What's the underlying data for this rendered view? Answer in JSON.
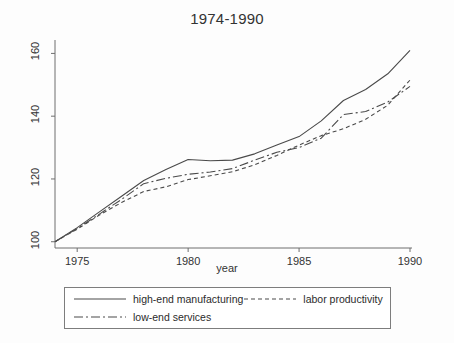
{
  "chart_data": {
    "type": "line",
    "title": "1974-1990",
    "xlabel": "year",
    "ylabel": "",
    "xlim": [
      1974,
      1990
    ],
    "ylim": [
      98,
      163
    ],
    "xticks": [
      1975,
      1980,
      1985,
      1990
    ],
    "yticks": [
      100,
      120,
      140,
      160
    ],
    "grid": false,
    "legend_position": "below-axis",
    "x": [
      1974,
      1975,
      1976,
      1977,
      1978,
      1979,
      1980,
      1981,
      1982,
      1983,
      1984,
      1985,
      1986,
      1987,
      1988,
      1989,
      1990
    ],
    "series": [
      {
        "name": "high-end manufacturing",
        "style": "solid",
        "values": [
          100,
          104.5,
          109.5,
          114.5,
          119.5,
          123.0,
          126.2,
          125.8,
          126.0,
          128.0,
          130.8,
          133.5,
          138.5,
          145.0,
          148.5,
          153.5,
          161.0
        ]
      },
      {
        "name": "labor productivity",
        "style": "dashed",
        "values": [
          100,
          104.0,
          108.5,
          112.5,
          116.0,
          117.5,
          119.8,
          121.0,
          122.3,
          124.5,
          127.5,
          130.8,
          133.8,
          136.0,
          139.0,
          143.5,
          151.5
        ]
      },
      {
        "name": "low-end services",
        "style": "dash-dot",
        "values": [
          100,
          104.2,
          108.8,
          113.5,
          118.5,
          120.2,
          121.5,
          122.2,
          123.3,
          126.0,
          128.5,
          130.0,
          133.0,
          140.5,
          141.5,
          144.5,
          149.5
        ]
      }
    ]
  },
  "legend": {
    "items": [
      {
        "label": "high-end manufacturing",
        "style": "solid"
      },
      {
        "label": "labor productivity",
        "style": "dashed"
      },
      {
        "label": "low-end services",
        "style": "dash-dot"
      }
    ]
  },
  "colors": {
    "line": "#4a4a4a",
    "axis": "#6e6e6e",
    "text": "#2b2b2b",
    "background": "#fdfdfd"
  }
}
